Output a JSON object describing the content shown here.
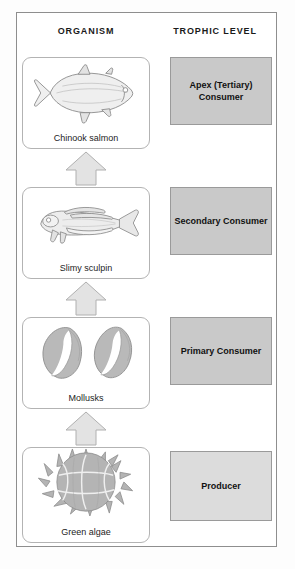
{
  "diagram": {
    "columns": {
      "organism_header": "ORGANISM",
      "trophic_header": "TROPHIC LEVEL"
    },
    "rows": [
      {
        "organism_label": "Chinook salmon",
        "organism_icon": "salmon-fish-illustration",
        "trophic_label": "Apex (Tertiary) Consumer",
        "trophic_fill": "#c9c9c9"
      },
      {
        "organism_label": "Slimy sculpin",
        "organism_icon": "sculpin-fish-illustration",
        "trophic_label": "Secondary Consumer",
        "trophic_fill": "#c9c9c9"
      },
      {
        "organism_label": "Mollusks",
        "organism_icon": "mollusk-shells-illustration",
        "trophic_label": "Primary Consumer",
        "trophic_fill": "#c9c9c9"
      },
      {
        "organism_label": "Green algae",
        "organism_icon": "green-algae-colony-illustration",
        "trophic_label": "Producer",
        "trophic_fill": "#dcdcdc"
      }
    ],
    "arrows": {
      "icon": "up-block-arrow",
      "count": 3,
      "fill": "#e3e3e3",
      "stroke": "#b0b0b0"
    },
    "colors": {
      "frame_border": "#8e8e8e",
      "card_border": "#b3b3b3",
      "text": "#1a1a1a",
      "background": "#ffffff"
    },
    "caption_partial": ""
  }
}
